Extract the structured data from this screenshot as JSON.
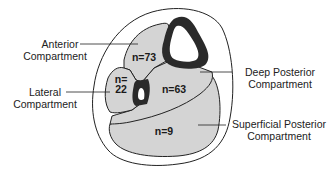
{
  "diagram": {
    "colors": {
      "compartment_fill": "#d4d4d4",
      "outline": "#222222",
      "bone": "#2a2a2a",
      "background": "#ffffff",
      "text": "#222222"
    },
    "compartments": [
      {
        "id": "anterior",
        "label_line1": "Anterior",
        "label_line2": "Compartment",
        "count": "n=73"
      },
      {
        "id": "lateral",
        "label_line1": "Lateral",
        "label_line2": "Compartment",
        "count_line1": "n=",
        "count_line2": "22"
      },
      {
        "id": "deep_posterior",
        "label_line1": "Deep Posterior",
        "label_line2": "Compartment",
        "count": "n=63"
      },
      {
        "id": "superficial_posterior",
        "label_line1": "Superficial Posterior",
        "label_line2": "Compartment",
        "count": "n=9"
      }
    ]
  }
}
